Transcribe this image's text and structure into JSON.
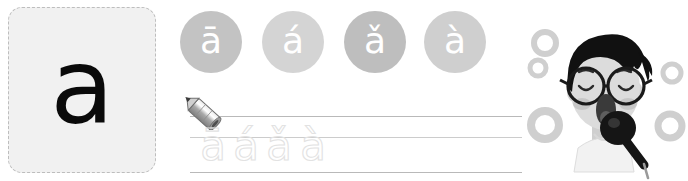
{
  "letter_card": {
    "letter": "a",
    "border_color": "#bdbdbd",
    "background": "#f1f1f1"
  },
  "tone_circles": [
    {
      "glyph": "ā",
      "name": "first-tone",
      "color": "#c3c3c3"
    },
    {
      "glyph": "á",
      "name": "second-tone",
      "color": "#d4d4d4"
    },
    {
      "glyph": "ǎ",
      "name": "third-tone",
      "color": "#bebebe"
    },
    {
      "glyph": "à",
      "name": "fourth-tone",
      "color": "#cfcfcf"
    }
  ],
  "writing_practice": {
    "pencil_icon": "pencil-icon",
    "line_color": "#b9b9b9",
    "trace_letters": [
      "ā",
      "á",
      "ǎ",
      "à"
    ],
    "trace_stroke_color": "#e2e2e2"
  },
  "illustration": {
    "name": "boy-singing-microphone",
    "hair_color": "#111111",
    "skin_color": "#d8d8d8",
    "glasses_color": "#1a1a1a",
    "microphone_color": "#151515",
    "bubble_color": "#cfcfcf",
    "bubbles": [
      {
        "cx": 25,
        "cy": 43,
        "r": 11
      },
      {
        "cx": 18,
        "cy": 68,
        "r": 8
      },
      {
        "cx": 25,
        "cy": 125,
        "r": 14
      },
      {
        "cx": 152,
        "cy": 73,
        "r": 9
      },
      {
        "cx": 150,
        "cy": 126,
        "r": 12
      }
    ]
  }
}
